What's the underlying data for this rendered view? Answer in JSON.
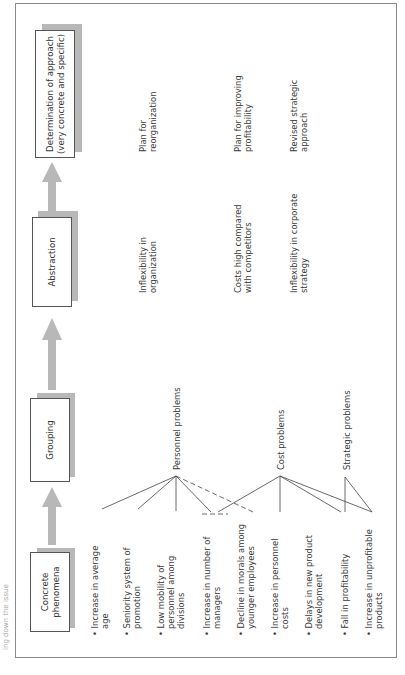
{
  "page_fragment": "ing down the issue",
  "stages": [
    {
      "id": "concrete",
      "label_lines": [
        "Concrete",
        "phenomena"
      ]
    },
    {
      "id": "grouping",
      "label_lines": [
        "Grouping"
      ]
    },
    {
      "id": "abstraction",
      "label_lines": [
        "Abstraction"
      ]
    },
    {
      "id": "determination",
      "label_lines": [
        "Determination of approach",
        "(very concrete and specific)"
      ]
    }
  ],
  "phenomena": [
    {
      "lines": [
        "Increase in average",
        "age"
      ]
    },
    {
      "lines": [
        "Seniority system of",
        "promotion"
      ]
    },
    {
      "lines": [
        "Low mobility of",
        "personnel among",
        "divisions"
      ]
    },
    {
      "lines": [
        "Increase in number of",
        "managers"
      ]
    },
    {
      "lines": [
        "Decline in morals among",
        "younger employees"
      ]
    },
    {
      "lines": [
        "Increase in personnel",
        "costs"
      ]
    },
    {
      "lines": [
        "Delays in new product",
        "development"
      ]
    },
    {
      "lines": [
        "Fall in profitability"
      ]
    },
    {
      "lines": [
        "Increase in unprofitable",
        "products"
      ]
    }
  ],
  "groups": [
    {
      "label": "Personnel problems"
    },
    {
      "label": "Cost problems"
    },
    {
      "label": "Strategic problems"
    }
  ],
  "abstractions": [
    {
      "lines": [
        "Inflexibility in",
        "organization"
      ]
    },
    {
      "lines": [
        "Costs high compared",
        "with competitors"
      ]
    },
    {
      "lines": [
        "Inflexibility in corporate",
        "strategy"
      ]
    }
  ],
  "determinations": [
    {
      "lines": [
        "Plan for",
        "reorganization"
      ]
    },
    {
      "lines": [
        "Plan for improving",
        "profitability"
      ]
    },
    {
      "lines": [
        "Revised strategic",
        "approach"
      ]
    }
  ],
  "colors": {
    "arrow": "#b8b8b8",
    "shadow": "#b8b8b8",
    "line": "#444444",
    "border": "#8a8a8a"
  }
}
